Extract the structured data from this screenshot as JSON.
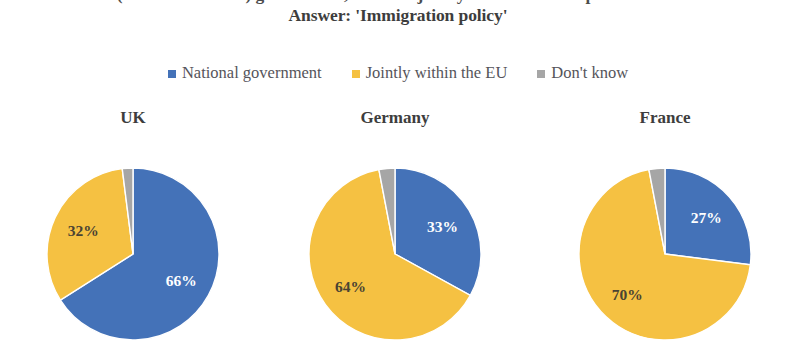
{
  "title": {
    "line1": "(NATIONALITY) government, or made jointly within the European Union?",
    "line2": "Answer: 'Immigration policy'"
  },
  "legend": {
    "items": [
      {
        "label": "National government",
        "color": "#4472B8",
        "marker": "square-marker"
      },
      {
        "label": "Jointly within the EU",
        "color": "#F5C142",
        "marker": "square-marker"
      },
      {
        "label": "Don't know",
        "color": "#A6A6A6",
        "marker": "square-marker"
      }
    ]
  },
  "colors": {
    "national_government": "#4472B8",
    "jointly_within_eu": "#F5C142",
    "dont_know": "#A6A6A6",
    "title_text": "#3d3d3d",
    "legend_text": "#55545a",
    "background": "#ffffff"
  },
  "panels": [
    {
      "title": "UK",
      "labels": [
        "66%",
        "32%",
        "2%"
      ]
    },
    {
      "title": "Germany",
      "labels": [
        "33%",
        "64%",
        "3%"
      ]
    },
    {
      "title": "France",
      "labels": [
        "27%",
        "70%",
        "3%"
      ]
    }
  ],
  "chart_data": {
    "type": "pie",
    "title": "(NATIONALITY) government, or made jointly within the European Union? Answer: 'Immigration policy'",
    "subtitle": "Answer: 'Immigration policy'",
    "xlabel": "",
    "ylabel": "",
    "grid": false,
    "legend_position": "top-center",
    "legend_entries": [
      "National government",
      "Jointly within the EU",
      "Don't know"
    ],
    "categories": [
      "National government",
      "Jointly within the EU",
      "Don't know"
    ],
    "slice_colors": [
      "#4472B8",
      "#F5C142",
      "#A6A6A6"
    ],
    "start_angle_deg": 0,
    "direction": "clockwise",
    "units": "percent",
    "charts": [
      {
        "title": "UK",
        "values": [
          66,
          32,
          2
        ],
        "data_labels": [
          "66%",
          "32%",
          "2%"
        ]
      },
      {
        "title": "Germany",
        "values": [
          33,
          64,
          3
        ],
        "data_labels": [
          "33%",
          "64%",
          "3%"
        ]
      },
      {
        "title": "France",
        "values": [
          27,
          70,
          3
        ],
        "data_labels": [
          "27%",
          "70%",
          "3%"
        ]
      }
    ]
  }
}
